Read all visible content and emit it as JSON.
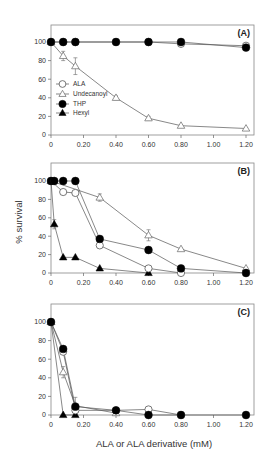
{
  "chart_data": {
    "type": "line",
    "layout": "three vertically stacked panels sharing x-axis scale",
    "ylabel": "% survival",
    "xlabel": "ALA or ALA derivative (mM)",
    "x_ticks": [
      "0",
      "0.20",
      "0.40",
      "0.60",
      "0.80",
      "1.00",
      "1.20"
    ],
    "y_ticks": [
      "0",
      "20",
      "40",
      "60",
      "80",
      "100"
    ],
    "xlim": [
      0,
      1.2
    ],
    "ylim": [
      0,
      100
    ],
    "grid": false,
    "legend": {
      "position": "inside panel A, left-middle",
      "entries": [
        {
          "name": "ALA",
          "marker": "open-circle"
        },
        {
          "name": "Undecanoyl",
          "marker": "open-triangle"
        },
        {
          "name": "THP",
          "marker": "filled-circle"
        },
        {
          "name": "Hexyl",
          "marker": "filled-triangle"
        }
      ]
    },
    "panels": [
      {
        "label": "(A)",
        "series": [
          {
            "name": "ALA",
            "marker": "open-circle",
            "x": [
              0,
              0.075,
              0.15,
              0.4,
              0.6,
              0.8,
              1.2
            ],
            "y": [
              100,
              100,
              100,
              100,
              100,
              98,
              96
            ]
          },
          {
            "name": "Undecanoyl",
            "marker": "open-triangle",
            "x": [
              0,
              0.075,
              0.15,
              0.4,
              0.6,
              0.8,
              1.2
            ],
            "y": [
              100,
              85,
              74,
              40,
              18,
              10,
              7
            ],
            "err": [
              0,
              5,
              9,
              2,
              2,
              1,
              1
            ]
          },
          {
            "name": "THP",
            "marker": "filled-circle",
            "x": [
              0,
              0.075,
              0.15,
              0.4,
              0.6,
              0.8,
              1.2
            ],
            "y": [
              100,
              100,
              100,
              100,
              100,
              100,
              94
            ]
          }
        ]
      },
      {
        "label": "(B)",
        "series": [
          {
            "name": "ALA",
            "marker": "open-circle",
            "x": [
              0,
              0.075,
              0.15,
              0.3,
              0.6,
              0.8
            ],
            "y": [
              100,
              88,
              87,
              30,
              5,
              0
            ]
          },
          {
            "name": "Undecanoyl",
            "marker": "open-triangle",
            "x": [
              0,
              0.3,
              0.6,
              0.8,
              1.2
            ],
            "y": [
              100,
              82,
              41,
              26,
              5
            ],
            "err": [
              0,
              4,
              6,
              1,
              1
            ]
          },
          {
            "name": "THP",
            "marker": "filled-circle",
            "x": [
              0,
              0.02,
              0.075,
              0.15,
              0.3,
              0.6,
              0.8,
              1.2
            ],
            "y": [
              100,
              100,
              100,
              100,
              37,
              25,
              5,
              0
            ]
          },
          {
            "name": "Hexyl",
            "marker": "filled-triangle",
            "x": [
              0,
              0.02,
              0.075,
              0.15,
              0.3,
              0.6
            ],
            "y": [
              100,
              53,
              17,
              17,
              5,
              0
            ],
            "err": [
              0,
              5,
              0,
              0,
              0,
              0
            ]
          }
        ]
      },
      {
        "label": "(C)",
        "series": [
          {
            "name": "ALA",
            "marker": "open-circle",
            "x": [
              0,
              0.075,
              0.15,
              0.4,
              0.6,
              0.8
            ],
            "y": [
              100,
              68,
              5,
              5,
              6,
              0
            ]
          },
          {
            "name": "Undecanoyl",
            "marker": "open-triangle",
            "x": [
              0,
              0.075,
              0.15,
              0.4
            ],
            "y": [
              100,
              46,
              10,
              2
            ],
            "err": [
              0,
              6,
              9,
              2
            ]
          },
          {
            "name": "THP",
            "marker": "filled-circle",
            "x": [
              0,
              0.075,
              0.15,
              0.4,
              0.6,
              0.8,
              1.2
            ],
            "y": [
              100,
              71,
              9,
              5,
              0,
              0,
              0
            ]
          },
          {
            "name": "Hexyl",
            "marker": "filled-triangle",
            "x": [
              0,
              0.075,
              0.15
            ],
            "y": [
              100,
              0,
              0
            ]
          }
        ]
      }
    ]
  },
  "geometry": {
    "x0px": 51,
    "x1px": 246,
    "boxRight": 254,
    "panels": [
      {
        "boxTop": 25,
        "y100": 42,
        "y0": 135
      },
      {
        "boxTop": 163,
        "y100": 181,
        "y0": 273
      },
      {
        "boxTop": 304,
        "y100": 322,
        "y0": 415
      }
    ]
  }
}
